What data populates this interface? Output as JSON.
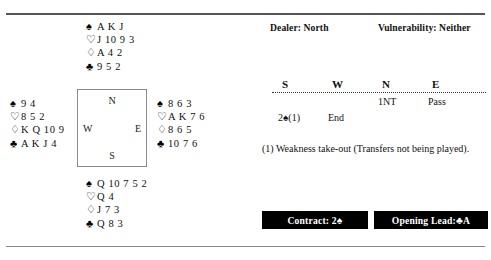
{
  "symbols": {
    "spade": "♠",
    "heart": "♡",
    "diamond": "♢",
    "club": "♣"
  },
  "deal": {
    "north": {
      "label": "North",
      "spades": "A K J",
      "hearts": "J 10 9 3",
      "diamonds": "A 4 2",
      "clubs": "9 5 2"
    },
    "west": {
      "label": "West",
      "spades": "9 4",
      "hearts": "8 5 2",
      "diamonds": "K Q 10 9",
      "clubs": "A K J 4"
    },
    "east": {
      "label": "East",
      "spades": "8 6 3",
      "hearts": "A K 7 6",
      "diamonds": "8 6 5",
      "clubs": "10 7 6"
    },
    "south": {
      "label": "South",
      "spades": "Q 10 7 5 2",
      "hearts": "Q 4",
      "diamonds": "J 7 3",
      "clubs": "Q 8 3"
    }
  },
  "compass": {
    "north": "N",
    "south": "S",
    "west": "W",
    "east": "E"
  },
  "meta": {
    "dealer": "Dealer: North",
    "vulnerability": "Vulnerability: Neither"
  },
  "auction": {
    "headers": {
      "south": "S",
      "west": "W",
      "north": "N",
      "east": "E"
    },
    "rows": [
      {
        "south": "",
        "west": "",
        "north": "1NT",
        "east": "Pass"
      },
      {
        "south": "2♠(1)",
        "west": "End",
        "north": "",
        "east": ""
      }
    ]
  },
  "note": "(1)  Weakness take-out (Transfers not being played).",
  "footer": {
    "contract_label": "Contract: 2",
    "contract_suit": "♠",
    "lead_label": "Opening Lead: ",
    "lead_suit": "♣",
    "lead_card": "A"
  }
}
